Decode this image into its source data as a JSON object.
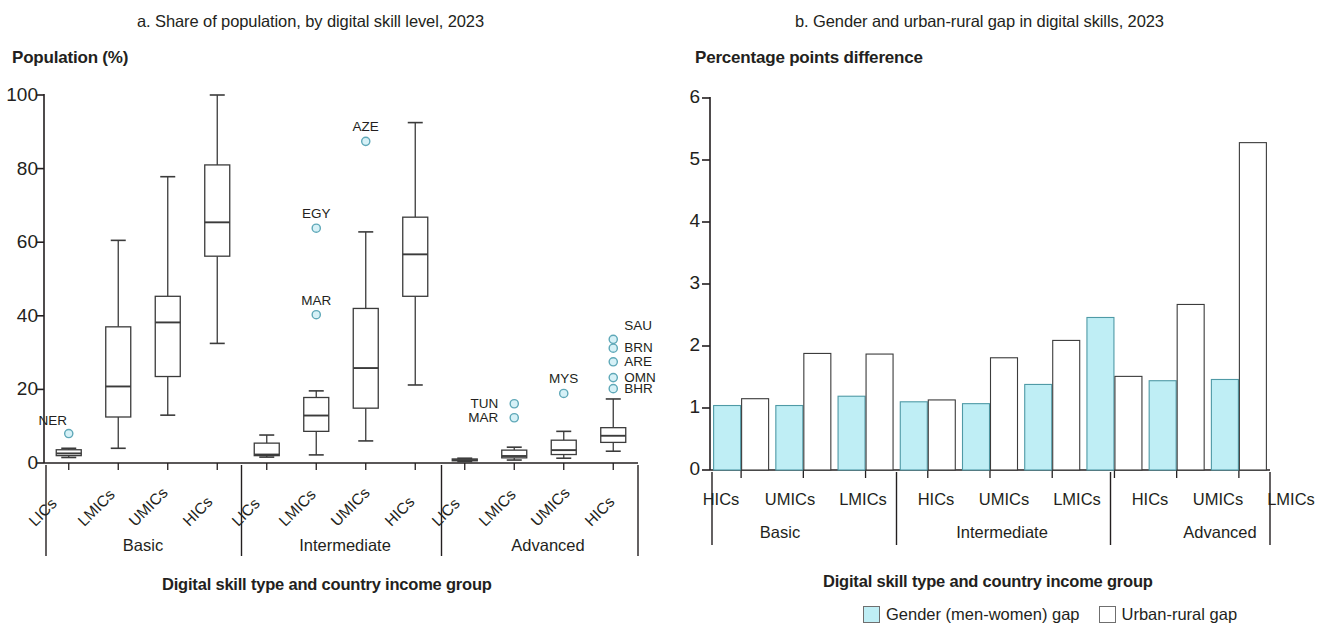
{
  "colors": {
    "gender_fill": "#bfeef5",
    "gender_stroke": "#4f9aa6",
    "urban_fill": "#ffffff",
    "urban_stroke": "#3b3b3b",
    "outlier_fill": "#d6f1f7",
    "outlier_stroke": "#5fa8b8",
    "axis": "#231f20",
    "box_stroke": "#3b3b3b"
  },
  "panel_a": {
    "title": "a. Share of population, by digital skill level, 2023",
    "y_axis_title": "Population (%)",
    "x_axis_title": "Digital skill type and country income group",
    "y_ticks": [
      "0",
      "20",
      "40",
      "60",
      "80",
      "100"
    ],
    "categories": [
      "LICs",
      "LMICs",
      "UMICs",
      "HICs"
    ],
    "groups": [
      "Basic",
      "Intermediate",
      "Advanced"
    ]
  },
  "panel_b": {
    "title": "b. Gender and urban-rural gap in digital skills, 2023",
    "y_axis_title": "Percentage points difference",
    "x_axis_title": "Digital skill type and country income group",
    "y_ticks": [
      "0",
      "1",
      "2",
      "3",
      "4",
      "5",
      "6"
    ],
    "categories": [
      "HICs",
      "UMICs",
      "LMICs"
    ],
    "groups": [
      "Basic",
      "Intermediate",
      "Advanced"
    ],
    "legend": [
      {
        "label": "Gender (men-women) gap",
        "swatch": "gender_fill"
      },
      {
        "label": "Urban-rural gap",
        "swatch": "urban_fill"
      }
    ]
  },
  "chart_data": [
    {
      "type": "box",
      "id": "panel-a-boxplot",
      "title": "a. Share of population, by digital skill level, 2023",
      "xlabel": "Digital skill type and country income group",
      "ylabel": "Population (%)",
      "ylim": [
        0,
        100
      ],
      "yticks": [
        0,
        20,
        40,
        60,
        80,
        100
      ],
      "grid": false,
      "group_labels": [
        "Basic",
        "Intermediate",
        "Advanced"
      ],
      "categories": [
        "LICs",
        "LMICs",
        "UMICs",
        "HICs"
      ],
      "boxes": [
        {
          "group": "Basic",
          "category": "LICs",
          "whisker_low": 1.5,
          "q1": 2.0,
          "median": 2.6,
          "q3": 3.6,
          "whisker_high": 4.0,
          "outliers": [
            {
              "label": "NER",
              "value": 8.0
            }
          ]
        },
        {
          "group": "Basic",
          "category": "LMICs",
          "whisker_low": 4.0,
          "q1": 12.5,
          "median": 20.8,
          "q3": 37.0,
          "whisker_high": 60.5,
          "outliers": []
        },
        {
          "group": "Basic",
          "category": "UMICs",
          "whisker_low": 13.0,
          "q1": 23.5,
          "median": 38.2,
          "q3": 45.3,
          "whisker_high": 77.8,
          "outliers": []
        },
        {
          "group": "Basic",
          "category": "HICs",
          "whisker_low": 32.5,
          "q1": 56.2,
          "median": 65.4,
          "q3": 81.0,
          "whisker_high": 100.0,
          "outliers": []
        },
        {
          "group": "Intermediate",
          "category": "LICs",
          "whisker_low": 1.6,
          "q1": 2.0,
          "median": 2.3,
          "q3": 5.4,
          "whisker_high": 7.6,
          "outliers": []
        },
        {
          "group": "Intermediate",
          "category": "LMICs",
          "whisker_low": 2.2,
          "q1": 8.6,
          "median": 12.9,
          "q3": 17.8,
          "whisker_high": 19.6,
          "outliers": [
            {
              "label": "MAR",
              "value": 40.3
            },
            {
              "label": "EGY",
              "value": 63.8
            }
          ]
        },
        {
          "group": "Intermediate",
          "category": "UMICs",
          "whisker_low": 6.0,
          "q1": 14.9,
          "median": 25.8,
          "q3": 42.0,
          "whisker_high": 62.8,
          "outliers": [
            {
              "label": "AZE",
              "value": 87.4
            }
          ]
        },
        {
          "group": "Intermediate",
          "category": "HICs",
          "whisker_low": 21.2,
          "q1": 45.3,
          "median": 56.7,
          "q3": 66.8,
          "whisker_high": 92.5,
          "outliers": []
        },
        {
          "group": "Advanced",
          "category": "LICs",
          "whisker_low": 0.4,
          "q1": 0.6,
          "median": 0.8,
          "q3": 1.1,
          "whisker_high": 1.3,
          "outliers": []
        },
        {
          "group": "Advanced",
          "category": "LMICs",
          "whisker_low": 0.8,
          "q1": 1.4,
          "median": 1.9,
          "q3": 3.5,
          "whisker_high": 4.3,
          "outliers": [
            {
              "label": "MAR",
              "value": 12.3
            },
            {
              "label": "TUN",
              "value": 16.1
            }
          ]
        },
        {
          "group": "Advanced",
          "category": "UMICs",
          "whisker_low": 1.3,
          "q1": 2.3,
          "median": 3.5,
          "q3": 6.2,
          "whisker_high": 8.6,
          "outliers": [
            {
              "label": "MYS",
              "value": 18.9
            }
          ]
        },
        {
          "group": "Advanced",
          "category": "HICs",
          "whisker_low": 3.2,
          "q1": 5.6,
          "median": 7.4,
          "q3": 9.6,
          "whisker_high": 17.4,
          "outliers": [
            {
              "label": "BHR",
              "value": 20.2
            },
            {
              "label": "OMN",
              "value": 23.2
            },
            {
              "label": "ARE",
              "value": 27.5
            },
            {
              "label": "BRN",
              "value": 31.2
            },
            {
              "label": "SAU",
              "value": 33.6
            }
          ]
        }
      ]
    },
    {
      "type": "bar",
      "id": "panel-b-bars",
      "title": "b. Gender and urban-rural gap in digital skills, 2023",
      "xlabel": "Digital skill type and country income group",
      "ylabel": "Percentage points difference",
      "ylim": [
        0,
        6
      ],
      "yticks": [
        0,
        1,
        2,
        3,
        4,
        5,
        6
      ],
      "grid": false,
      "legend_position": "bottom",
      "group_labels": [
        "Basic",
        "Intermediate",
        "Advanced"
      ],
      "categories": [
        "Basic / HICs",
        "Basic / UMICs",
        "Basic / LMICs",
        "Intermediate / HICs",
        "Intermediate / UMICs",
        "Intermediate / LMICs",
        "Advanced / HICs",
        "Advanced / UMICs",
        "Advanced / LMICs"
      ],
      "series": [
        {
          "name": "Gender (men-women) gap",
          "values": [
            1.04,
            1.04,
            1.19,
            1.1,
            1.07,
            1.38,
            2.46,
            1.44,
            1.46
          ]
        },
        {
          "name": "Urban-rural gap",
          "values": [
            1.15,
            1.88,
            1.87,
            1.13,
            1.81,
            2.09,
            1.51,
            2.67,
            5.28
          ]
        }
      ]
    }
  ]
}
